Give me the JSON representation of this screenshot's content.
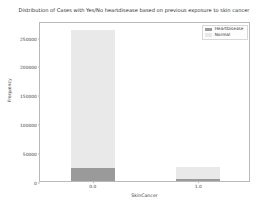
{
  "chart_data": {
    "type": "bar",
    "subtype": "stacked-bar",
    "title": "Distribution of Cases with Yes/No heartdisease based on previous exposure to skin cancer",
    "xlabel": "SkinCancer",
    "ylabel": "Frequency",
    "categories": [
      "0.0",
      "1.0"
    ],
    "xtick_labels": [
      "0.0",
      "1.0"
    ],
    "ytick_labels": [
      "0",
      "50000",
      "100000",
      "150000",
      "200000",
      "250000"
    ],
    "ytick_values": [
      0,
      50000,
      100000,
      150000,
      200000,
      250000
    ],
    "ylim": [
      0,
      277000
    ],
    "grid": false,
    "legend_position": "upper right",
    "series": [
      {
        "name": "HeartDisease",
        "color": "#9a9a9a",
        "values": [
          22000,
          4000
        ]
      },
      {
        "name": "Normal",
        "color": "#e9e9e9",
        "values": [
          240000,
          21000
        ]
      }
    ],
    "stack_totals": [
      262000,
      25000
    ],
    "bar_width_fraction": 0.21
  },
  "legend": {
    "items": [
      {
        "label": "HeartDisease",
        "color": "#9a9a9a"
      },
      {
        "label": "Normal",
        "color": "#e9e9e9"
      }
    ]
  },
  "colors": {
    "heart_disease": "#9a9a9a",
    "normal": "#e9e9e9",
    "axis": "#b9b9b9",
    "text": "#3c3c3c",
    "background": "#ffffff"
  }
}
